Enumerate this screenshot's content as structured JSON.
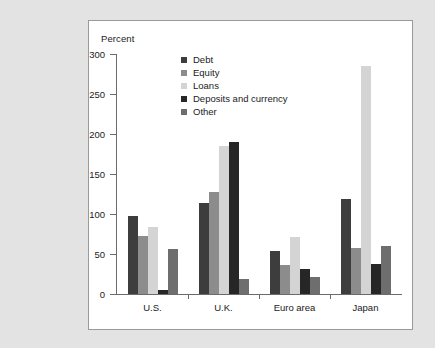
{
  "page": {
    "background_color": "#e3e3e3",
    "panel_background": "#ffffff",
    "panel_border_color": "#9a9a9a"
  },
  "chart_data": {
    "type": "bar",
    "title": "",
    "subtitle": "",
    "axis_title": "Percent",
    "xlabel": "",
    "ylabel": "Percent",
    "ylim": [
      0,
      300
    ],
    "yticks": [
      0,
      50,
      100,
      150,
      200,
      250,
      300
    ],
    "ytick_labels": [
      "0",
      "50",
      "100",
      "150",
      "200",
      "250",
      "300"
    ],
    "grid": false,
    "legend_position": "top-center",
    "categories": [
      "U.S.",
      "U.K.",
      "Euro area",
      "Japan"
    ],
    "series": [
      {
        "name": "Debt",
        "color": "#3d3d3d",
        "values": [
          98,
          114,
          54,
          119
        ]
      },
      {
        "name": "Equity",
        "color": "#8c8c8c",
        "values": [
          73,
          127,
          36,
          57
        ]
      },
      {
        "name": "Loans",
        "color": "#d4d4d4",
        "values": [
          84,
          185,
          71,
          285
        ]
      },
      {
        "name": "Deposits and currency",
        "color": "#262626",
        "values": [
          5,
          190,
          31,
          37
        ]
      },
      {
        "name": "Other",
        "color": "#6e6e6e",
        "values": [
          56,
          19,
          21,
          60
        ]
      }
    ]
  }
}
